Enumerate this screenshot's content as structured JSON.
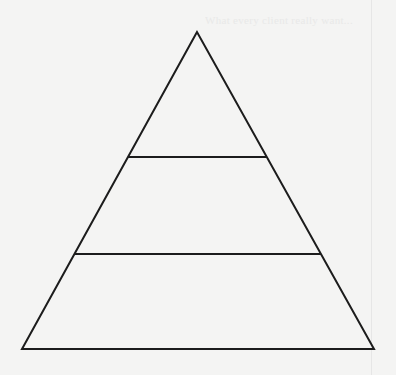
{
  "diagram": {
    "type": "pyramid",
    "tiers": 3,
    "stroke_color": "#1c1c1c",
    "background_color": "#f4f4f3",
    "apex": {
      "x": 197,
      "y": 32
    },
    "base_left": {
      "x": 22,
      "y": 349
    },
    "base_right": {
      "x": 374,
      "y": 349
    },
    "dividers": [
      {
        "y": 157,
        "x1": 128,
        "x2": 267
      },
      {
        "y": 254,
        "x1": 75,
        "x2": 321
      }
    ],
    "tier_labels": [
      "",
      "",
      ""
    ]
  },
  "bleed_through_text": "What every client really want..."
}
